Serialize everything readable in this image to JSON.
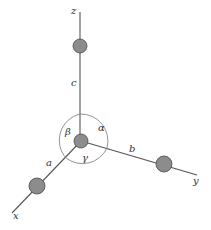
{
  "diagram": {
    "title": "",
    "axes": {
      "x": {
        "label": "x"
      },
      "y": {
        "label": "y"
      },
      "z": {
        "label": "z"
      }
    },
    "edges": {
      "a": {
        "label": "a"
      },
      "b": {
        "label": "b"
      },
      "c": {
        "label": "c"
      }
    },
    "angles": {
      "alpha": {
        "label": "α"
      },
      "beta": {
        "label": "β"
      },
      "gamma": {
        "label": "γ"
      }
    },
    "colors": {
      "axis": "#555555",
      "sphere_fill": "#8c8c8c",
      "sphere_stroke": "#4a4a4a",
      "arc": "#777777",
      "background": "#ffffff"
    }
  }
}
